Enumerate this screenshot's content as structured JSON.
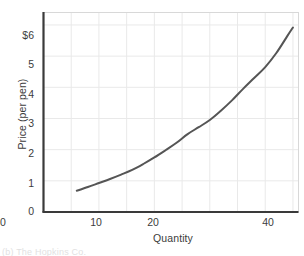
{
  "figure": {
    "background_color": "#ffffff",
    "caption_fragment": "(b) The Hopkins Co."
  },
  "chart_data": {
    "type": "line",
    "title": "",
    "subtitle": "",
    "xlabel": "Quantity",
    "ylabel": "Price (per pen)",
    "xlim": [
      0,
      46
    ],
    "ylim": [
      0,
      6.4
    ],
    "grid": true,
    "legend": null,
    "axis_color": "#3a3a3a",
    "grid_color": "#e9e9e9",
    "curve_color": "#555555",
    "curve_width": 2,
    "x_ticks": [
      {
        "value": 10,
        "label": "10"
      },
      {
        "value": 20,
        "label": "20"
      },
      {
        "value": 30,
        "label": "30"
      },
      {
        "value": 40,
        "label": "40"
      }
    ],
    "y_ticks": [
      {
        "value": 6,
        "label": "$6"
      },
      {
        "value": 5,
        "label": "5"
      },
      {
        "value": 4,
        "label": "4"
      },
      {
        "value": 3,
        "label": "3"
      },
      {
        "value": 2,
        "label": "2"
      },
      {
        "value": 1,
        "label": "1"
      },
      {
        "value": 0,
        "label": "0"
      }
    ],
    "x_gridlines": [
      5,
      10,
      15,
      20,
      25,
      30,
      35,
      40,
      45
    ],
    "y_gridlines": [
      1,
      2,
      3,
      4,
      5,
      6
    ],
    "series": [
      {
        "name": "Supply",
        "x": [
          6,
          8,
          10,
          12,
          14,
          16,
          18,
          20,
          22,
          24,
          26,
          28,
          30,
          32,
          34,
          36,
          38,
          40,
          42,
          44,
          45
        ],
        "values": [
          0.68,
          0.8,
          0.93,
          1.06,
          1.2,
          1.35,
          1.54,
          1.75,
          1.98,
          2.22,
          2.5,
          2.72,
          2.95,
          3.25,
          3.58,
          3.95,
          4.3,
          4.65,
          5.1,
          5.65,
          5.92
        ]
      }
    ]
  }
}
